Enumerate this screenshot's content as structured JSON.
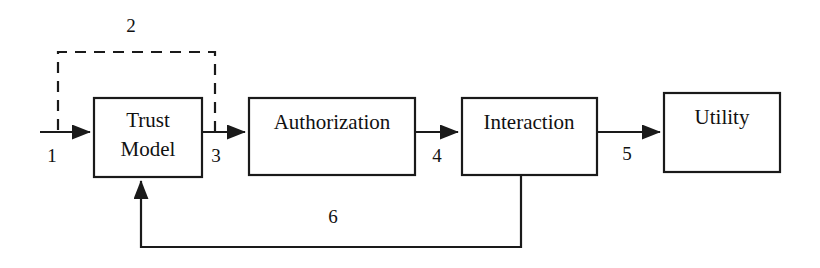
{
  "diagram": {
    "background_color": "#ffffff",
    "line_color": "#1a1a1a",
    "text_color": "#111111",
    "nodes": [
      {
        "id": "trust-model",
        "label_line1": "Trust",
        "label_line2": "Model",
        "x": 94,
        "y": 98,
        "w": 108,
        "h": 79
      },
      {
        "id": "authorization",
        "label_line1": "Authorization",
        "label_line2": "",
        "x": 249,
        "y": 98,
        "w": 166,
        "h": 77
      },
      {
        "id": "interaction",
        "label_line1": "Interaction",
        "label_line2": "",
        "x": 462,
        "y": 98,
        "w": 135,
        "h": 77
      },
      {
        "id": "utility",
        "label_line1": "Utility",
        "label_line2": "",
        "x": 664,
        "y": 93,
        "w": 116,
        "h": 79
      }
    ],
    "edges": [
      {
        "id": "edge-1",
        "label": "1",
        "style": "solid",
        "from": "input",
        "to": "trust-model",
        "label_x": 52,
        "label_y": 162
      },
      {
        "id": "edge-2",
        "label": "2",
        "style": "dashed",
        "from": "trust-model-output",
        "to": "trust-model-input",
        "label_x": 131,
        "label_y": 32
      },
      {
        "id": "edge-3",
        "label": "3",
        "style": "solid",
        "from": "trust-model",
        "to": "authorization",
        "label_x": 216,
        "label_y": 162
      },
      {
        "id": "edge-4",
        "label": "4",
        "style": "solid",
        "from": "authorization",
        "to": "interaction",
        "label_x": 437,
        "label_y": 162
      },
      {
        "id": "edge-5",
        "label": "5",
        "style": "solid",
        "from": "interaction",
        "to": "utility",
        "label_x": 627,
        "label_y": 160
      },
      {
        "id": "edge-6",
        "label": "6",
        "style": "solid",
        "from": "interaction",
        "to": "trust-model",
        "label_x": 333,
        "label_y": 223
      }
    ]
  }
}
